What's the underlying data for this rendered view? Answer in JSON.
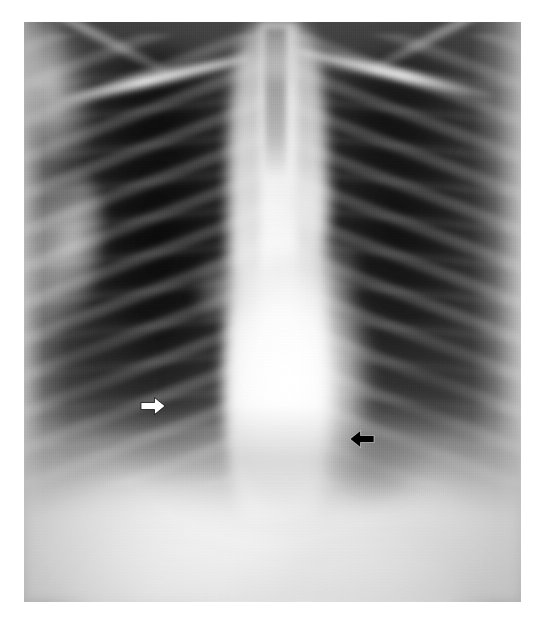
{
  "figure": {
    "type": "medical-radiograph",
    "modality": "chest-x-ray",
    "projection": "PA",
    "caption": "",
    "background_color": "#ffffff",
    "plate": {
      "x": 24,
      "y": 22,
      "width": 497,
      "height": 580,
      "border_color": "#ffffff"
    }
  },
  "annotations": [
    {
      "id": "white-arrow",
      "name": "white-arrow-annotation",
      "glyph": "arrow-right-icon",
      "direction": "right",
      "color": "#ffffff",
      "outline_color": "#000000",
      "x": 140,
      "y": 396,
      "width": 26,
      "height": 20,
      "region": "right lung field / right cardiac border"
    },
    {
      "id": "black-arrow",
      "name": "black-arrow-annotation",
      "glyph": "arrow-left-icon",
      "direction": "left",
      "color": "#000000",
      "outline_color": "#ffffff",
      "x": 349,
      "y": 429,
      "width": 26,
      "height": 20,
      "region": "left cardiac border / descending aorta"
    }
  ],
  "anatomy": {
    "structures": [
      {
        "name": "right-lung-field",
        "radiodensity": "lucent",
        "tone": "#161616"
      },
      {
        "name": "left-lung-field",
        "radiodensity": "lucent",
        "tone": "#1c1c1c"
      },
      {
        "name": "trachea",
        "radiodensity": "lucent",
        "tone": "#6a6a6a"
      },
      {
        "name": "mediastinum",
        "radiodensity": "dense",
        "tone": "#f0f0f0"
      },
      {
        "name": "thoracic-spine",
        "radiodensity": "dense",
        "tone": "#f6f6f6"
      },
      {
        "name": "cardiac-silhouette",
        "radiodensity": "dense",
        "tone": "#fafafa"
      },
      {
        "name": "aortic-knob",
        "radiodensity": "dense",
        "tone": "#ebebeb"
      },
      {
        "name": "right-hilum",
        "radiodensity": "intermediate",
        "tone": "#bebebe"
      },
      {
        "name": "left-hilum",
        "radiodensity": "intermediate",
        "tone": "#b4b4b4"
      },
      {
        "name": "diaphragm",
        "radiodensity": "dense",
        "tone": "#f5f5f5"
      },
      {
        "name": "gastric-bubble",
        "radiodensity": "lucent",
        "tone": "#464646"
      },
      {
        "name": "right-costophrenic-angle",
        "radiodensity": "lucent",
        "tone": "#262626"
      },
      {
        "name": "left-costophrenic-angle",
        "radiodensity": "lucent",
        "tone": "#2d2d2d"
      },
      {
        "name": "right-clavicle",
        "radiodensity": "dense",
        "tone": "#ffffff"
      },
      {
        "name": "left-clavicle",
        "radiodensity": "dense",
        "tone": "#ffffff"
      },
      {
        "name": "right-scapula",
        "radiodensity": "dense",
        "tone": "#f2f2f2"
      },
      {
        "name": "left-scapula",
        "radiodensity": "dense",
        "tone": "#f2f2f2"
      },
      {
        "name": "right-humeral-head",
        "radiodensity": "dense",
        "tone": "#f0f0f0"
      },
      {
        "name": "left-humeral-head",
        "radiodensity": "dense",
        "tone": "#f0f0f0"
      },
      {
        "name": "right-rib-cage",
        "radiodensity": "dense",
        "tone": "#d6d6d6"
      },
      {
        "name": "left-rib-cage",
        "radiodensity": "dense",
        "tone": "#d2d2d2"
      },
      {
        "name": "right-chest-wall-soft-tissue",
        "radiodensity": "intermediate",
        "tone": "#d7d7d7"
      },
      {
        "name": "left-chest-wall-soft-tissue",
        "radiodensity": "intermediate",
        "tone": "#dcdcdc"
      }
    ]
  },
  "palette": {
    "page_background": "#ffffff",
    "lung_dark": "#141414",
    "mediastinum_bright": "#ffffff",
    "midtone": "#707070",
    "arrow_white": "#ffffff",
    "arrow_black": "#000000"
  }
}
